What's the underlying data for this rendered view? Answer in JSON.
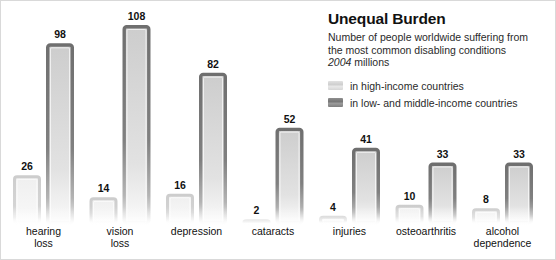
{
  "figure": {
    "title": "Unequal Burden",
    "subtitle_line1": "Number of people worldwide suffering from",
    "subtitle_line2": "the most common disabling conditions",
    "subtitle_year": "2004",
    "subtitle_unit": "millions"
  },
  "legend": {
    "items": [
      {
        "label": "in high-income countries",
        "color": "#d8d8d8",
        "key": "high_income"
      },
      {
        "label": "in low- and middle-income countries",
        "color": "#808080",
        "key": "low_middle_income"
      }
    ]
  },
  "colors": {
    "series_light": "#d8d8d8",
    "series_dark": "#808080",
    "frame": "#d9d9d9",
    "text": "#111111",
    "background": "#ffffff"
  },
  "chart_data": {
    "type": "bar",
    "title": "Unequal Burden",
    "subtitle": "Number of people worldwide suffering from the most common disabling conditions, 2004 millions",
    "xlabel": "",
    "ylabel": "millions of people",
    "ylim": [
      0,
      108
    ],
    "grid": false,
    "legend_position": "top-right",
    "bar_style": "outlined-hollow",
    "grouping": "grouped",
    "categories": [
      "hearing loss",
      "vision loss",
      "depression",
      "cataracts",
      "injuries",
      "osteoarthritis",
      "alcohol dependence"
    ],
    "series": [
      {
        "name": "in high-income countries",
        "color": "#d8d8d8",
        "values": [
          26,
          14,
          16,
          2,
          4,
          10,
          8
        ]
      },
      {
        "name": "in low- and middle-income countries",
        "color": "#808080",
        "values": [
          98,
          108,
          82,
          52,
          41,
          33,
          33
        ]
      }
    ],
    "data_labels": [
      {
        "category": "hearing loss",
        "high_income": 26,
        "low_middle_income": 98
      },
      {
        "category": "vision loss",
        "high_income": 14,
        "low_middle_income": 108
      },
      {
        "category": "depression",
        "high_income": 16,
        "low_middle_income": 82
      },
      {
        "category": "cataracts",
        "high_income": 2,
        "low_middle_income": 52
      },
      {
        "category": "injuries",
        "high_income": 4,
        "low_middle_income": 41
      },
      {
        "category": "osteoarthritis",
        "high_income": 10,
        "low_middle_income": 33
      },
      {
        "category": "alcohol dependence",
        "high_income": 8,
        "low_middle_income": 33
      }
    ]
  },
  "category_labels": [
    {
      "line1": "hearing",
      "line2": "loss"
    },
    {
      "line1": "vision",
      "line2": "loss"
    },
    {
      "line1": "depression",
      "line2": ""
    },
    {
      "line1": "cataracts",
      "line2": ""
    },
    {
      "line1": "injuries",
      "line2": ""
    },
    {
      "line1": "osteoarthritis",
      "line2": ""
    },
    {
      "line1": "alcohol",
      "line2": "dependence"
    }
  ],
  "value_labels": {
    "light": [
      "26",
      "14",
      "16",
      "2",
      "4",
      "10",
      "8"
    ],
    "dark": [
      "98",
      "108",
      "82",
      "52",
      "41",
      "33",
      "33"
    ]
  }
}
